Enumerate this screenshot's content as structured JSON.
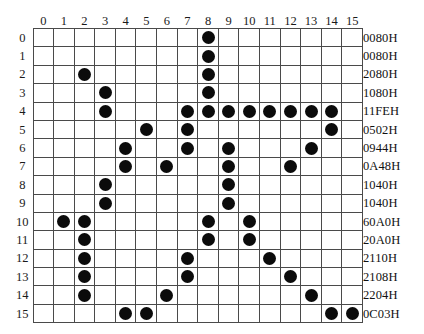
{
  "figure": {
    "grid_size": 16,
    "dot_color": "#0b0b0b",
    "grid_line_color": "#4a4a4a",
    "background_color": "#ffffff"
  },
  "column_headers": [
    "0",
    "1",
    "2",
    "3",
    "4",
    "5",
    "6",
    "7",
    "8",
    "9",
    "10",
    "11",
    "12",
    "13",
    "14",
    "15"
  ],
  "row_headers": [
    "0",
    "1",
    "2",
    "3",
    "4",
    "5",
    "6",
    "7",
    "8",
    "9",
    "10",
    "11",
    "12",
    "13",
    "14",
    "15"
  ],
  "hex_labels": [
    "0080H",
    "0080H",
    "2080H",
    "1080H",
    "11FEH",
    "0502H",
    "0944H",
    "0A48H",
    "1040H",
    "1040H",
    "60A0H",
    "20A0H",
    "2110H",
    "2108H",
    "2204H",
    "0C03H"
  ],
  "chart_data": {
    "type": "heatmap",
    "xlabel": "",
    "ylabel": "",
    "x": [
      "0",
      "1",
      "2",
      "3",
      "4",
      "5",
      "6",
      "7",
      "8",
      "9",
      "10",
      "11",
      "12",
      "13",
      "14",
      "15"
    ],
    "y": [
      "0",
      "1",
      "2",
      "3",
      "4",
      "5",
      "6",
      "7",
      "8",
      "9",
      "10",
      "11",
      "12",
      "13",
      "14",
      "15"
    ],
    "grid": [
      [
        0,
        0,
        0,
        0,
        0,
        0,
        0,
        0,
        1,
        0,
        0,
        0,
        0,
        0,
        0,
        0
      ],
      [
        0,
        0,
        0,
        0,
        0,
        0,
        0,
        0,
        1,
        0,
        0,
        0,
        0,
        0,
        0,
        0
      ],
      [
        0,
        0,
        1,
        0,
        0,
        0,
        0,
        0,
        1,
        0,
        0,
        0,
        0,
        0,
        0,
        0
      ],
      [
        0,
        0,
        0,
        1,
        0,
        0,
        0,
        0,
        1,
        0,
        0,
        0,
        0,
        0,
        0,
        0
      ],
      [
        0,
        0,
        0,
        1,
        0,
        0,
        0,
        1,
        1,
        1,
        1,
        1,
        1,
        1,
        1,
        0
      ],
      [
        0,
        0,
        0,
        0,
        0,
        1,
        0,
        1,
        0,
        0,
        0,
        0,
        0,
        0,
        1,
        0
      ],
      [
        0,
        0,
        0,
        0,
        1,
        0,
        0,
        1,
        0,
        1,
        0,
        0,
        0,
        1,
        0,
        0
      ],
      [
        0,
        0,
        0,
        0,
        1,
        0,
        1,
        0,
        0,
        1,
        0,
        0,
        1,
        0,
        0,
        0
      ],
      [
        0,
        0,
        0,
        1,
        0,
        0,
        0,
        0,
        0,
        1,
        0,
        0,
        0,
        0,
        0,
        0
      ],
      [
        0,
        0,
        0,
        1,
        0,
        0,
        0,
        0,
        0,
        1,
        0,
        0,
        0,
        0,
        0,
        0
      ],
      [
        0,
        1,
        1,
        0,
        0,
        0,
        0,
        0,
        1,
        0,
        1,
        0,
        0,
        0,
        0,
        0
      ],
      [
        0,
        0,
        1,
        0,
        0,
        0,
        0,
        0,
        1,
        0,
        1,
        0,
        0,
        0,
        0,
        0
      ],
      [
        0,
        0,
        1,
        0,
        0,
        0,
        0,
        1,
        0,
        0,
        0,
        1,
        0,
        0,
        0,
        0
      ],
      [
        0,
        0,
        1,
        0,
        0,
        0,
        0,
        1,
        0,
        0,
        0,
        0,
        1,
        0,
        0,
        0
      ],
      [
        0,
        0,
        1,
        0,
        0,
        0,
        1,
        0,
        0,
        0,
        0,
        0,
        0,
        1,
        0,
        0
      ],
      [
        0,
        0,
        0,
        0,
        1,
        1,
        0,
        0,
        0,
        0,
        0,
        0,
        0,
        0,
        1,
        1
      ]
    ],
    "row_values_hex": [
      "0080H",
      "0080H",
      "2080H",
      "1080H",
      "11FEH",
      "0502H",
      "0944H",
      "0A48H",
      "1040H",
      "1040H",
      "60A0H",
      "20A0H",
      "2110H",
      "2108H",
      "2204H",
      "0C03H"
    ],
    "legend": [],
    "grid_on": true
  }
}
